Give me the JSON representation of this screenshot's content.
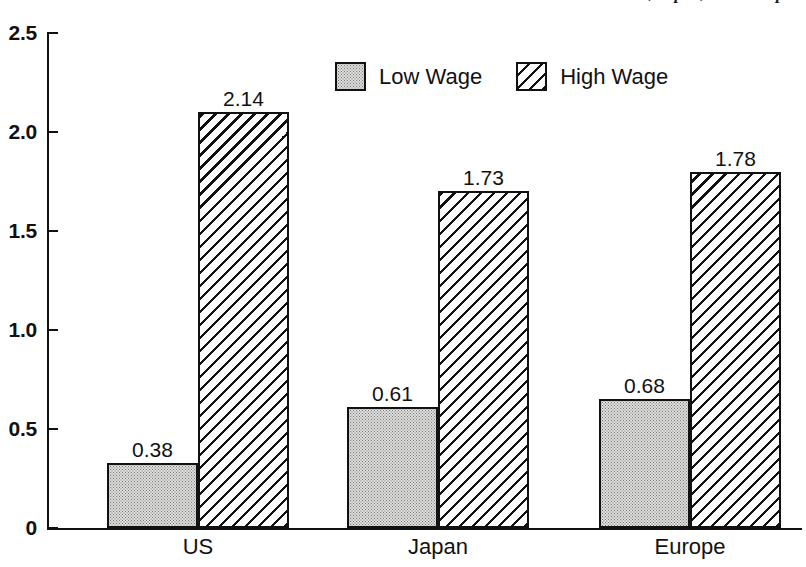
{
  "chart_data": {
    "type": "bar",
    "title": "s, Japan, and Europe",
    "title_clipped": true,
    "subtitle": "",
    "xlabel": "",
    "ylabel": "",
    "categories": [
      "US",
      "Japan",
      "Europe"
    ],
    "ylim": [
      0,
      2.5
    ],
    "yticks": [
      0,
      0.5,
      1.0,
      1.5,
      2.0,
      2.5
    ],
    "ytick_labels": [
      "0",
      "0.5",
      "1.0",
      "1.5",
      "2.0",
      "2.5"
    ],
    "grid": false,
    "legend_position": "top-center",
    "series": [
      {
        "name": "Low Wage",
        "fill": "stipple",
        "values": [
          0.38,
          0.61,
          0.68
        ],
        "value_labels": [
          "0.38",
          "0.61",
          "0.68"
        ],
        "drawn_heights": [
          0.33,
          0.61,
          0.65
        ]
      },
      {
        "name": "High Wage",
        "fill": "diagonal-hatch",
        "values": [
          2.14,
          1.73,
          1.78
        ],
        "value_labels": [
          "2.14",
          "1.73",
          "1.78"
        ],
        "drawn_heights": [
          2.1,
          1.7,
          1.8
        ]
      }
    ],
    "colors": {
      "ink": "#111111",
      "low_wage_fill": "#dededc",
      "high_wage_fill": "#ffffff",
      "background": "#ffffff"
    }
  }
}
